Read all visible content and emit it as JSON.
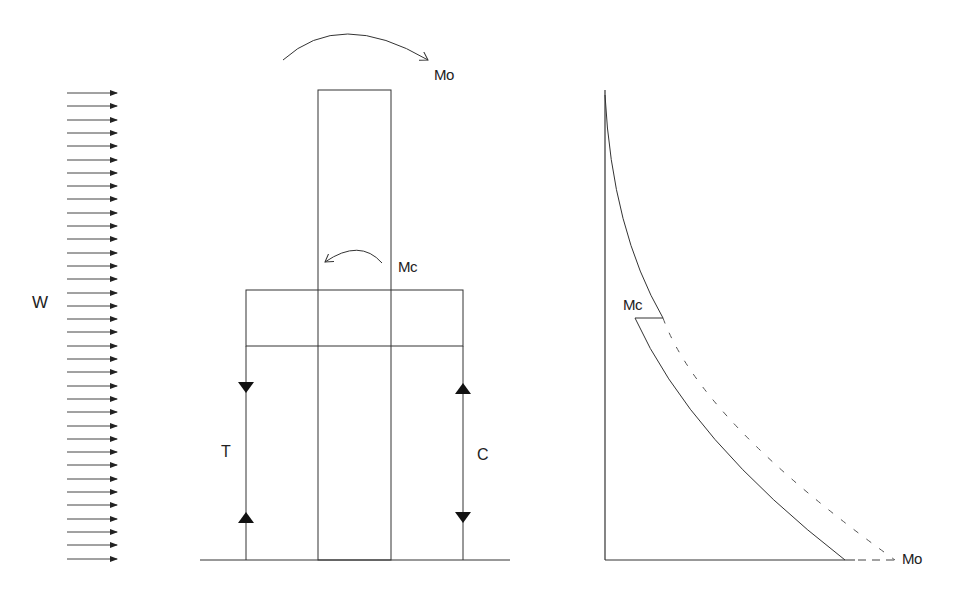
{
  "diagram": {
    "type": "outrigger-structure-moment-diagram",
    "colors": {
      "line": "#333333",
      "dashed": "#555555",
      "background": "#ffffff"
    },
    "wind_load": {
      "label": "W",
      "arrow_count": 36,
      "x_start": 67,
      "x_end": 117,
      "y_first": 93,
      "y_spacing": 13.3
    },
    "structure": {
      "core": {
        "x": 318,
        "y": 90,
        "width": 73,
        "ground_y": 560
      },
      "outrigger": {
        "x": 246,
        "y": 290,
        "width": 217,
        "height": 56
      },
      "top_moment": {
        "label": "Mo"
      },
      "core_moment": {
        "label": "Mc"
      },
      "tension_column": {
        "label": "T",
        "x": 246
      },
      "compression_column": {
        "label": "C",
        "x": 463
      },
      "ground_line": {
        "x1": 200,
        "x2": 510,
        "y": 560
      }
    },
    "moment_diagram": {
      "axis_x": 605,
      "top_y": 90,
      "base_y": 560,
      "jump_label": "Mc",
      "base_label": "Mo",
      "curves": [
        {
          "name": "with-outrigger",
          "style": "solid"
        },
        {
          "name": "without-outrigger",
          "style": "dashed"
        }
      ]
    }
  },
  "labels": {
    "w": "W",
    "mo_top": "Mo",
    "mc_core": "Mc",
    "t": "T",
    "c": "C",
    "mc_diagram": "Mc",
    "mo_diagram": "Mo"
  }
}
